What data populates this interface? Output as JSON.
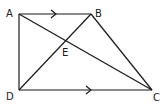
{
  "diagram": {
    "points": {
      "A": {
        "label": "A",
        "x": 19,
        "y": 14
      },
      "B": {
        "label": "B",
        "x": 91,
        "y": 14
      },
      "C": {
        "label": "C",
        "x": 152,
        "y": 90
      },
      "D": {
        "label": "D",
        "x": 19,
        "y": 90
      },
      "E": {
        "label": "E",
        "x": 63,
        "y": 41
      }
    },
    "segments": [
      "AB",
      "BC",
      "CD",
      "DA",
      "AC",
      "BD"
    ],
    "parallel_marks": [
      "AB",
      "DC"
    ],
    "color": "#1a1a1a"
  }
}
